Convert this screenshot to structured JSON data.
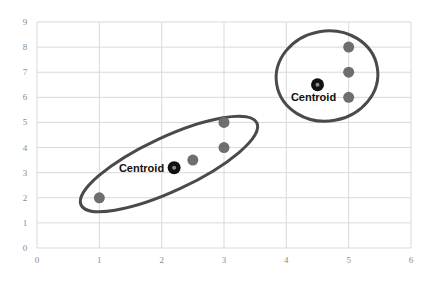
{
  "chart_data": {
    "type": "scatter",
    "title": "",
    "xlabel": "",
    "ylabel": "",
    "xlim": [
      0,
      6
    ],
    "ylim": [
      0,
      9
    ],
    "x_ticks": [
      "0",
      "1",
      "2",
      "3",
      "4",
      "5",
      "6"
    ],
    "y_ticks": [
      "0",
      "1",
      "2",
      "3",
      "4",
      "5",
      "6",
      "7",
      "8",
      "9"
    ],
    "grid": true,
    "legend": null,
    "series": [
      {
        "name": "Cluster 1 points",
        "points": [
          [
            1,
            2
          ],
          [
            2.5,
            3.5
          ],
          [
            3,
            4
          ],
          [
            3,
            5
          ]
        ]
      },
      {
        "name": "Cluster 2 points",
        "points": [
          [
            5,
            8
          ],
          [
            5,
            7
          ],
          [
            5,
            6
          ]
        ]
      },
      {
        "name": "Centroids",
        "points": [
          [
            2.2,
            3.2
          ],
          [
            4.5,
            6.5
          ]
        ]
      }
    ],
    "annotations": [
      {
        "text": "Centroid",
        "x": 2.2,
        "y": 3.2,
        "position": "left"
      },
      {
        "text": "Centroid",
        "x": 4.5,
        "y": 6.5,
        "position": "below"
      }
    ],
    "shapes": [
      {
        "type": "ellipse",
        "encloses": "Cluster 1",
        "center": [
          2.1,
          3.3
        ],
        "angle_deg": -25
      },
      {
        "type": "ellipse",
        "encloses": "Cluster 2",
        "center": [
          4.8,
          6.8
        ],
        "angle_deg": -10
      }
    ]
  },
  "colors": {
    "background": "#ffffff",
    "grid": "#d9d9d9",
    "point": "#6e6e6e",
    "centroid": "#111111",
    "centroid_core": "#8a8a8a",
    "ellipse": "#4a4a4a",
    "tick_text": "#8a8a8a"
  }
}
